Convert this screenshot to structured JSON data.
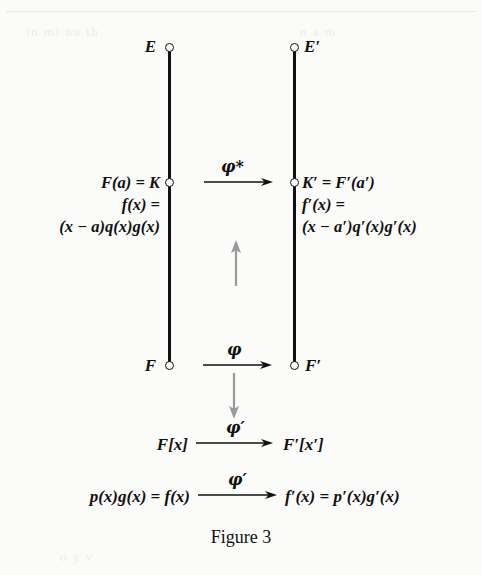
{
  "figure": {
    "caption": "Figure 3",
    "background_color": "#fbfbf9",
    "ink_color": "#111111",
    "gray_arrow_color": "#9a9a9a"
  },
  "nodes": {
    "top_left": {
      "label": "E"
    },
    "top_right": {
      "label": "E′"
    },
    "mid_left": {
      "line1": "F(a) = K",
      "line2": "f(x) =",
      "line3": "(x − a)q(x)g(x)"
    },
    "mid_right": {
      "line1": "K′ = F′(a′)",
      "line2": "f′(x) =",
      "line3": "(x − a′)q′(x)g′(x)"
    },
    "bottom_left": {
      "label": "F"
    },
    "bottom_right": {
      "label": "F′"
    }
  },
  "rows": {
    "poly_ring": {
      "left": "F[x]",
      "right": "F′[x′]",
      "arrow_label": "φ′"
    },
    "poly_element": {
      "left": "p(x)g(x) = f(x)",
      "right": "f′(x) = p′(x)g′(x)",
      "arrow_label": "φ′"
    }
  },
  "arrows": {
    "phi_star": {
      "label": "φ*"
    },
    "phi": {
      "label": "φ"
    },
    "gray_up": {
      "label": ""
    },
    "gray_down": {
      "label": ""
    }
  },
  "showthrough": {
    "line1": "in  mi   nu  th",
    "line2": "n     a     m",
    "line3": "o   y       v"
  }
}
